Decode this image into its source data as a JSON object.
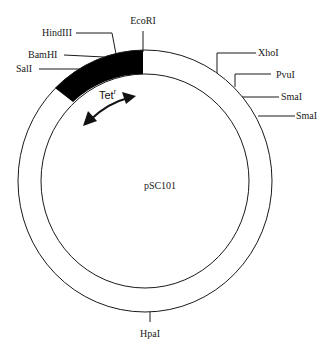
{
  "plasmid": {
    "name": "pSC101",
    "colors": {
      "ring": "#1a1a1a",
      "gene_fill": "#000000",
      "background": "#ffffff"
    },
    "gene": {
      "label": "Tet",
      "superscript": "r"
    },
    "sites": {
      "ecori": "EcoRI",
      "hindiii": "HindIII",
      "bamhi": "BamHI",
      "sali": "SalI",
      "xhoi": "XhoI",
      "pvui": "PvuI",
      "smai_1": "SmaI",
      "smai_2": "SmaI",
      "hpai": "HpaI"
    }
  }
}
